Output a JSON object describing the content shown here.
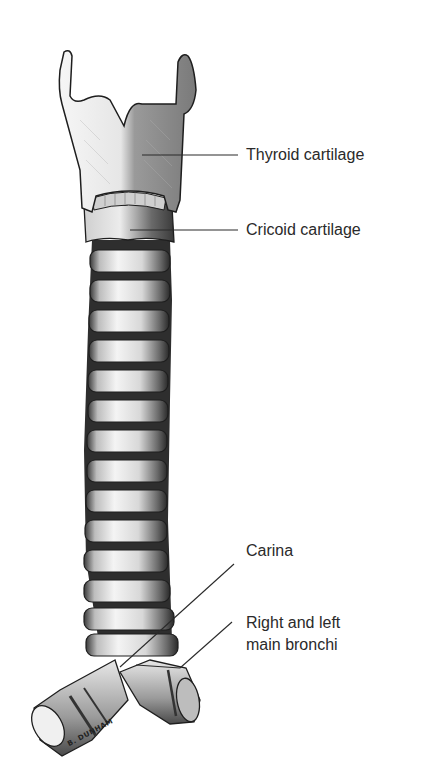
{
  "diagram": {
    "labels": [
      {
        "id": "thyroid",
        "text": "Thyroid cartilage"
      },
      {
        "id": "cricoid",
        "text": "Cricoid cartilage"
      },
      {
        "id": "carina",
        "text": "Carina"
      },
      {
        "id": "bronchi_line1",
        "text": "Right and left"
      },
      {
        "id": "bronchi_line2",
        "text": "main bronchi"
      }
    ],
    "signature": "B. DUNHAM",
    "colors": {
      "ink": "#2a2a2a",
      "cartilage_light": "#f2f2f2",
      "cartilage_shade": "#8a8a8a",
      "background": "#ffffff"
    }
  }
}
